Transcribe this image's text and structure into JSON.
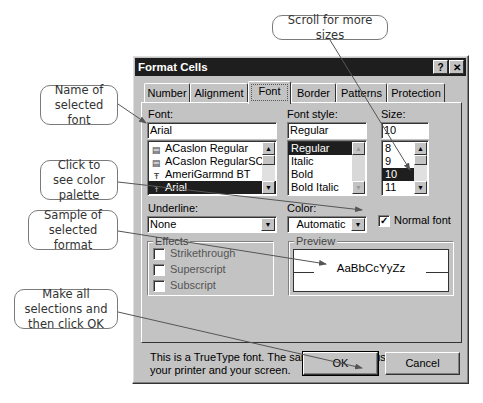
{
  "callouts": {
    "name_of_font": "Name of selected font",
    "color_palette": "Click to see color palette",
    "sample_format": "Sample of selected format",
    "make_selections": "Make all selections and then click OK",
    "scroll_sizes": "Scroll for more sizes"
  },
  "dialog": {
    "title": "Format Cells",
    "help_icon": "?",
    "close_icon": "✕",
    "tabs": [
      {
        "label": "Number",
        "active": false
      },
      {
        "label": "Alignment",
        "active": false
      },
      {
        "label": "Font",
        "active": true
      },
      {
        "label": "Border",
        "active": false
      },
      {
        "label": "Patterns",
        "active": false
      },
      {
        "label": "Protection",
        "active": false
      }
    ],
    "font": {
      "label": "Font:",
      "value": "Arial",
      "items": [
        {
          "label": "ACaslon Regular",
          "icon": "printer-font-icon",
          "selected": false
        },
        {
          "label": "ACaslon RegularSC",
          "icon": "printer-font-icon",
          "selected": false
        },
        {
          "label": "AmeriGarmnd BT",
          "icon": "truetype-icon",
          "selected": false
        },
        {
          "label": "Arial",
          "icon": "truetype-icon",
          "selected": true
        }
      ]
    },
    "font_style": {
      "label": "Font style:",
      "value": "Regular",
      "items": [
        {
          "label": "Regular",
          "selected": true
        },
        {
          "label": "Italic",
          "selected": false
        },
        {
          "label": "Bold",
          "selected": false
        },
        {
          "label": "Bold Italic",
          "selected": false
        }
      ]
    },
    "size": {
      "label": "Size:",
      "value": "10",
      "items": [
        {
          "label": "8",
          "selected": false
        },
        {
          "label": "9",
          "selected": false
        },
        {
          "label": "10",
          "selected": true
        },
        {
          "label": "11",
          "selected": false
        }
      ]
    },
    "underline": {
      "label": "Underline:",
      "value": "None"
    },
    "color": {
      "label": "Color:",
      "value": "Automatic"
    },
    "normal_font": {
      "label": "Normal font",
      "checked": true,
      "check_glyph": "✓"
    },
    "effects": {
      "title": "Effects",
      "items": [
        {
          "label": "Strikethrough",
          "checked": false
        },
        {
          "label": "Superscript",
          "checked": false
        },
        {
          "label": "Subscript",
          "checked": false
        }
      ]
    },
    "preview": {
      "title": "Preview",
      "sample": "AaBbCcYyZz"
    },
    "info_text": "This is a TrueType font.  The same font will be used on both your printer and your screen.",
    "ok_label": "OK",
    "cancel_label": "Cancel"
  }
}
